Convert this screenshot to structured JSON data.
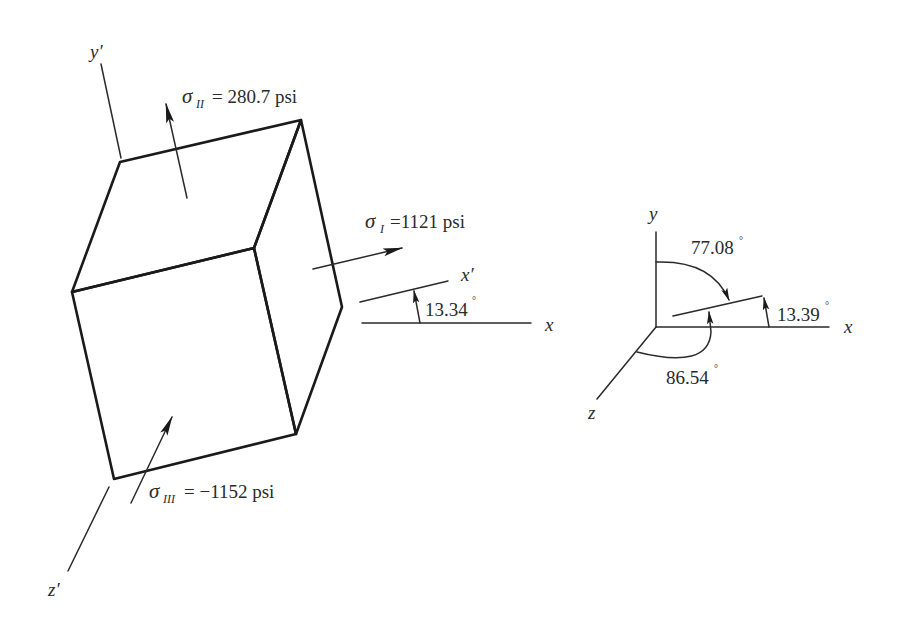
{
  "figure": {
    "type": "principal-stress-element",
    "element": {
      "axes": {
        "y_prime": "y′",
        "z_prime": "z′",
        "x_prime": "x′",
        "x": "x"
      },
      "stresses": [
        {
          "symbol": "σ",
          "subscript": "II",
          "equals": "= 280.7 psi",
          "value": 280.7,
          "unit": "psi"
        },
        {
          "symbol": "σ",
          "subscript": "I",
          "equals": "=1121 psi",
          "value": 1121,
          "unit": "psi"
        },
        {
          "symbol": "σ",
          "subscript": "III",
          "equals": "= −1152 psi",
          "value": -1152,
          "unit": "psi"
        }
      ],
      "rotation_angle": {
        "label": "13.34",
        "value": 13.34,
        "unit": "°"
      }
    },
    "orientation_diagram": {
      "axes": {
        "x": "x",
        "y": "y",
        "z": "z"
      },
      "angles": [
        {
          "label": "77.08",
          "value": 77.08,
          "unit": "°",
          "from_axis": "y"
        },
        {
          "label": "13.39",
          "value": 13.39,
          "unit": "°",
          "from_axis": "x"
        },
        {
          "label": "86.54",
          "value": 86.54,
          "unit": "°",
          "from_axis": "z"
        }
      ]
    },
    "colors": {
      "line": "#1a1a1a",
      "text": "#2a2a2a",
      "background": "#ffffff"
    }
  }
}
